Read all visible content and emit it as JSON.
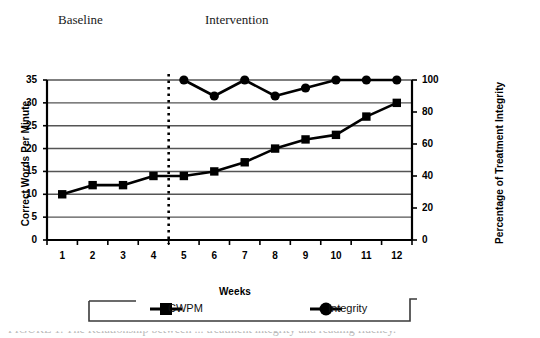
{
  "figure": {
    "phase_labels": [
      {
        "name": "baseline",
        "text": "Baseline"
      },
      {
        "name": "intervention",
        "text": "Intervention"
      }
    ],
    "caption_partial": "FIGURE 1.   The Relationship between ... treatment integrity and reading fluency."
  },
  "legend": {
    "entries": [
      {
        "name": "cwpm",
        "label": "CWPM",
        "marker": "square",
        "color": "#000000"
      },
      {
        "name": "integrity",
        "label": "Integrity",
        "marker": "circle",
        "color": "#000000"
      }
    ]
  },
  "chart_data": {
    "type": "line",
    "title": "",
    "xlabel": "Weeks",
    "ylabel": "Correct Words Per Minute",
    "y2label": "Percentage of Treatment Integrity",
    "categories": [
      "1",
      "2",
      "3",
      "4",
      "5",
      "6",
      "7",
      "8",
      "9",
      "10",
      "11",
      "12"
    ],
    "x": [
      1,
      2,
      3,
      4,
      5,
      6,
      7,
      8,
      9,
      10,
      11,
      12
    ],
    "ylim": [
      0,
      35
    ],
    "yticks": [
      0,
      5,
      10,
      15,
      20,
      25,
      30,
      35
    ],
    "y2lim": [
      0,
      100
    ],
    "y2ticks": [
      0,
      20,
      40,
      60,
      80,
      100
    ],
    "grid": true,
    "legend_position": "bottom",
    "phase_change_line": {
      "after_category": "4",
      "style": "dotted",
      "label": "baseline/intervention split"
    },
    "series": [
      {
        "name": "CWPM",
        "axis": "left",
        "marker": "square",
        "values": [
          10,
          12,
          12,
          14,
          14,
          15,
          17,
          20,
          22,
          23,
          27,
          30
        ]
      },
      {
        "name": "Integrity",
        "axis": "right",
        "marker": "circle",
        "values": [
          null,
          null,
          null,
          null,
          100,
          90,
          100,
          90,
          95,
          100,
          100,
          100
        ]
      }
    ]
  }
}
